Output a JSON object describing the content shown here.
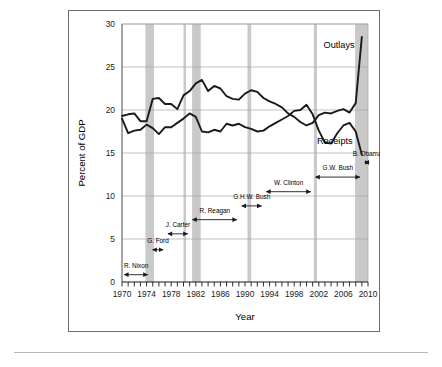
{
  "figure": {
    "border_color": "#6f6f6f",
    "background": "#ffffff",
    "rule_color": "#b9b9b9"
  },
  "chart_data": {
    "type": "line",
    "title": "",
    "xlabel": "Year",
    "ylabel": "Percent of GDP",
    "xlim": [
      1970,
      2010
    ],
    "ylim": [
      0,
      30
    ],
    "ytick_step": 5,
    "yticks": [
      0,
      5,
      10,
      15,
      20,
      25,
      30
    ],
    "xticks": [
      1970,
      1974,
      1978,
      1982,
      1986,
      1990,
      1994,
      1998,
      2002,
      2006,
      2010
    ],
    "xtick_minor_step": 1,
    "grid": "horizontal",
    "legend": "inline-labels",
    "x": [
      1970,
      1971,
      1972,
      1973,
      1974,
      1975,
      1976,
      1977,
      1978,
      1979,
      1980,
      1981,
      1982,
      1983,
      1984,
      1985,
      1986,
      1987,
      1988,
      1989,
      1990,
      1991,
      1992,
      1993,
      1994,
      1995,
      1996,
      1997,
      1998,
      1999,
      2000,
      2001,
      2002,
      2003,
      2004,
      2005,
      2006,
      2007,
      2008,
      2009
    ],
    "series": [
      {
        "name": "Outlays",
        "color": "#1a1a1a",
        "label_x": 2005.3,
        "label_y": 27.2,
        "values": [
          19.3,
          19.5,
          19.6,
          18.7,
          18.7,
          21.3,
          21.4,
          20.7,
          20.7,
          20.1,
          21.7,
          22.2,
          23.1,
          23.5,
          22.2,
          22.8,
          22.5,
          21.6,
          21.3,
          21.2,
          21.9,
          22.3,
          22.1,
          21.4,
          21.0,
          20.7,
          20.3,
          19.6,
          19.2,
          18.6,
          18.2,
          18.5,
          19.4,
          19.7,
          19.6,
          19.9,
          20.1,
          19.7,
          20.8,
          28.5
        ]
      },
      {
        "name": "Receipts",
        "color": "#1a1a1a",
        "label_x": 2004.6,
        "label_y": 16.0,
        "values": [
          19.0,
          17.3,
          17.6,
          17.7,
          18.3,
          17.9,
          17.2,
          18.0,
          18.0,
          18.5,
          19.0,
          19.6,
          19.2,
          17.5,
          17.4,
          17.7,
          17.5,
          18.4,
          18.2,
          18.4,
          18.0,
          17.8,
          17.5,
          17.6,
          18.1,
          18.5,
          18.9,
          19.3,
          19.9,
          20.0,
          20.6,
          19.5,
          17.6,
          16.2,
          16.1,
          17.3,
          18.2,
          18.5,
          17.5,
          14.8
        ]
      }
    ],
    "recession_bands": [
      {
        "start": 1973.8,
        "end": 1975.2,
        "color": "#c9c9c9"
      },
      {
        "start": 1980.0,
        "end": 1980.4,
        "color": "#c9c9c9"
      },
      {
        "start": 1981.4,
        "end": 1982.8,
        "color": "#c9c9c9"
      },
      {
        "start": 1990.4,
        "end": 1991.0,
        "color": "#c9c9c9"
      },
      {
        "start": 2001.2,
        "end": 2001.7,
        "color": "#c9c9c9"
      },
      {
        "start": 2007.9,
        "end": 2010.0,
        "color": "#c9c9c9"
      }
    ],
    "presidents": [
      {
        "name": "R. Nixon",
        "start": 1970.0,
        "end": 1974.6,
        "label_y": 1.6,
        "arrow_y": 0.85
      },
      {
        "name": "G. Ford",
        "start": 1974.6,
        "end": 1977.1,
        "label_y": 4.5,
        "arrow_y": 3.75
      },
      {
        "name": "J. Carter",
        "start": 1977.1,
        "end": 1981.1,
        "label_y": 6.4,
        "arrow_y": 5.6
      },
      {
        "name": "R. Reagan",
        "start": 1981.1,
        "end": 1989.1,
        "label_y": 8.0,
        "arrow_y": 7.25
      },
      {
        "name": "G.H.W. Bush",
        "start": 1989.1,
        "end": 1993.1,
        "label_y": 9.6,
        "arrow_y": 8.85
      },
      {
        "name": "W. Clinton",
        "start": 1993.1,
        "end": 2001.1,
        "label_y": 11.3,
        "arrow_y": 10.5
      },
      {
        "name": "G.W. Bush",
        "start": 2001.1,
        "end": 2009.1,
        "label_y": 13.0,
        "arrow_y": 12.2
      },
      {
        "name": "B. Obama",
        "start": 2009.1,
        "end": 2010.6,
        "label_y": 14.7,
        "arrow_y": 13.9
      }
    ]
  }
}
